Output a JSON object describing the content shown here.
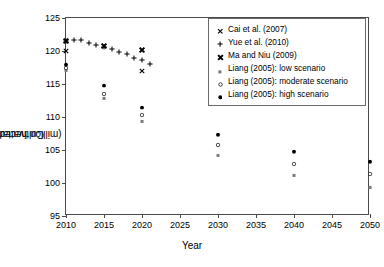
{
  "chart_data": {
    "type": "scatter",
    "title": "",
    "xlabel": "Year",
    "ylabel": "Cultivated land area\n(million hectares)",
    "ylabel_line1": "Cultivated land area",
    "ylabel_line2": "(million hectares)",
    "xlim": [
      2010,
      2050
    ],
    "ylim": [
      95,
      125
    ],
    "xticks": [
      2010,
      2015,
      2020,
      2025,
      2030,
      2035,
      2040,
      2045,
      2050
    ],
    "yticks": [
      95,
      100,
      105,
      110,
      115,
      120,
      125
    ],
    "grid": false,
    "legend_position": "upper right",
    "series": [
      {
        "name": "Cai et al. (2007)",
        "marker": "x",
        "color": "#000000",
        "points": [
          {
            "x": 2010,
            "y": 120.0
          },
          {
            "x": 2020,
            "y": 117.0
          }
        ]
      },
      {
        "name": "Yue et al. (2010)",
        "marker": "plus",
        "color": "#000000",
        "points": [
          {
            "x": 2010,
            "y": 121.5
          },
          {
            "x": 2011,
            "y": 121.7
          },
          {
            "x": 2012,
            "y": 121.6
          },
          {
            "x": 2013,
            "y": 121.2
          },
          {
            "x": 2014,
            "y": 120.9
          },
          {
            "x": 2015,
            "y": 120.6
          },
          {
            "x": 2016,
            "y": 120.3
          },
          {
            "x": 2017,
            "y": 119.9
          },
          {
            "x": 2018,
            "y": 119.5
          },
          {
            "x": 2019,
            "y": 119.0
          },
          {
            "x": 2020,
            "y": 118.6
          },
          {
            "x": 2021,
            "y": 118.1
          }
        ]
      },
      {
        "name": "Ma and Niu (2009)",
        "marker": "x-bold",
        "color": "#000000",
        "points": [
          {
            "x": 2010,
            "y": 121.5
          },
          {
            "x": 2015,
            "y": 120.7
          },
          {
            "x": 2020,
            "y": 120.1
          }
        ]
      },
      {
        "name": "Liang (2005): low scenario",
        "marker": "small-gray-square",
        "color": "#7a7a7a",
        "points": [
          {
            "x": 2010,
            "y": 117.1
          },
          {
            "x": 2015,
            "y": 112.9
          },
          {
            "x": 2020,
            "y": 109.4
          },
          {
            "x": 2030,
            "y": 104.3
          },
          {
            "x": 2040,
            "y": 101.2
          },
          {
            "x": 2050,
            "y": 99.4
          }
        ]
      },
      {
        "name": "Liang (2005): moderate scenario",
        "marker": "open-circle",
        "color": "#000000",
        "points": [
          {
            "x": 2010,
            "y": 117.5
          },
          {
            "x": 2015,
            "y": 113.5
          },
          {
            "x": 2020,
            "y": 110.3
          },
          {
            "x": 2030,
            "y": 105.8
          },
          {
            "x": 2040,
            "y": 102.9
          },
          {
            "x": 2050,
            "y": 101.3
          }
        ]
      },
      {
        "name": "Liang (2005): high scenario",
        "marker": "filled-circle",
        "color": "#000000",
        "points": [
          {
            "x": 2010,
            "y": 117.9
          },
          {
            "x": 2015,
            "y": 114.8
          },
          {
            "x": 2020,
            "y": 111.5
          },
          {
            "x": 2030,
            "y": 107.3
          },
          {
            "x": 2040,
            "y": 104.7
          },
          {
            "x": 2050,
            "y": 103.2
          }
        ]
      }
    ]
  }
}
